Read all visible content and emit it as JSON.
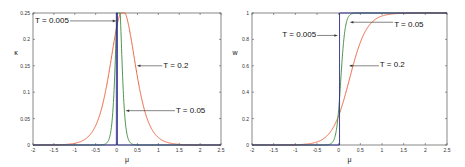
{
  "chart_data": [
    {
      "type": "line",
      "title": "",
      "xlabel": "μ",
      "ylabel": "κ",
      "xlim": [
        -2,
        2.5
      ],
      "ylim": [
        0,
        0.25
      ],
      "xticks": [
        "-2",
        "-1.5",
        "-1",
        "-0.5",
        "0",
        "0.5",
        "1",
        "1.5",
        "2",
        "2.5"
      ],
      "yticks": [
        "0",
        "0.05",
        "0.1",
        "0.15",
        "0.2",
        "0.25"
      ],
      "grid": false,
      "series": [
        {
          "name": "T = 0.005",
          "color": "#2b2b8c",
          "description": "spike at μ≈0 reaching 0.25"
        },
        {
          "name": "T = 0.05",
          "color": "#3a8a3a",
          "peak_x": 0.05,
          "peak_y": 0.25
        },
        {
          "name": "T = 0.2",
          "color": "#e8542c",
          "peak_x": 0.15,
          "peak_y": 0.25
        }
      ],
      "annotations": [
        {
          "text": "T = 0.005",
          "x": -0.9,
          "y": 0.235
        },
        {
          "text": "T = 0.2",
          "x": 1.2,
          "y": 0.15
        },
        {
          "text": "T = 0.05",
          "x": 1.6,
          "y": 0.065
        }
      ]
    },
    {
      "type": "line",
      "title": "",
      "xlabel": "μ",
      "ylabel": "w",
      "xlim": [
        -2,
        2.5
      ],
      "ylim": [
        0,
        1
      ],
      "xticks": [
        "-2",
        "-1.5",
        "-1",
        "-0.5",
        "0",
        "0.5",
        "1",
        "1.5",
        "2",
        "2.5"
      ],
      "yticks": [
        "0",
        "0.2",
        "0.4",
        "0.6",
        "0.8",
        "1"
      ],
      "grid": false,
      "series": [
        {
          "name": "T = 0.005",
          "color": "#2b2b8c",
          "description": "step at μ=0 from 0 to 1"
        },
        {
          "name": "T = 0.05",
          "color": "#3a8a3a",
          "description": "steep sigmoid centered near 0"
        },
        {
          "name": "T = 0.2",
          "color": "#e8542c",
          "description": "smooth sigmoid, w≈0.22 at μ=0"
        }
      ],
      "annotations": [
        {
          "text": "T = 0.005",
          "x": -0.9,
          "y": 0.83
        },
        {
          "text": "T = 0.05",
          "x": 1.3,
          "y": 0.93
        },
        {
          "text": "T = 0.2",
          "x": 0.9,
          "y": 0.6
        }
      ]
    }
  ]
}
